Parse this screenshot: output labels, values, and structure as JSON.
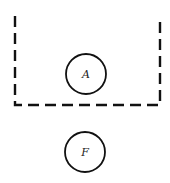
{
  "diagram": {
    "boundary": {
      "style": "dashed",
      "sides": [
        "left",
        "bottom",
        "right"
      ],
      "color": "#111111"
    },
    "nodes": [
      {
        "id": "A",
        "label": "A",
        "cx": 86,
        "cy": 74,
        "r": 20,
        "inside_boundary": true
      },
      {
        "id": "F",
        "label": "F",
        "cx": 85,
        "cy": 152,
        "r": 20,
        "inside_boundary": false
      }
    ]
  }
}
